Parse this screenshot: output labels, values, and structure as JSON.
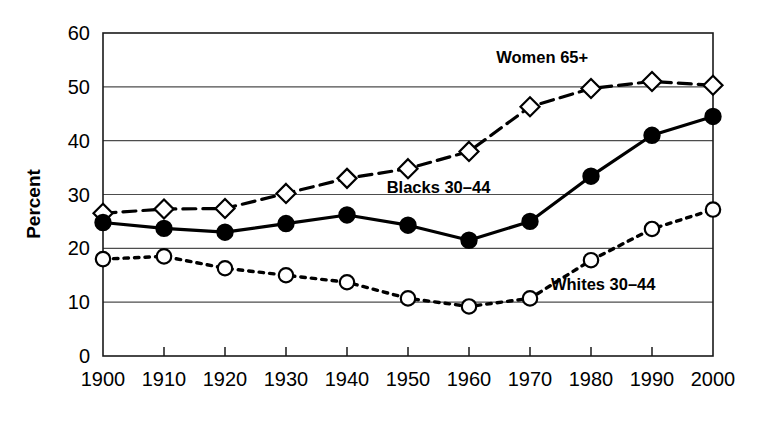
{
  "chart_data": {
    "type": "line",
    "title": "",
    "xlabel": "",
    "ylabel": "Percent",
    "x": [
      1900,
      1910,
      1920,
      1930,
      1940,
      1950,
      1960,
      1970,
      1980,
      1990,
      2000
    ],
    "xtick_labels": [
      "1900",
      "1910",
      "1920",
      "1930",
      "1940",
      "1950",
      "1960",
      "1970",
      "1980",
      "1990",
      "2000"
    ],
    "ytick_labels": [
      "0",
      "10",
      "20",
      "30",
      "40",
      "50",
      "60"
    ],
    "yticks": [
      0,
      10,
      20,
      30,
      40,
      50,
      60
    ],
    "ylim": [
      0,
      60
    ],
    "xlim": [
      1900,
      2000
    ],
    "grid": "horizontal",
    "legend_position": "inline-annotations",
    "series": [
      {
        "name": "Women 65+",
        "label": "Women 65+",
        "marker": "diamond-open",
        "linestyle": "dashed",
        "color": "#000000",
        "label_x": 1972,
        "label_y": 54.5,
        "values": [
          26.5,
          27.3,
          27.4,
          30.2,
          33.0,
          34.8,
          38.0,
          46.3,
          49.7,
          51.0,
          50.3
        ]
      },
      {
        "name": "Blacks 30-44",
        "label": "Blacks 30–44",
        "marker": "circle-filled",
        "linestyle": "solid",
        "color": "#000000",
        "label_x": 1955,
        "label_y": 30.2,
        "values": [
          24.8,
          23.7,
          23.0,
          24.6,
          26.2,
          24.3,
          21.5,
          25.0,
          33.4,
          41.0,
          44.5
        ]
      },
      {
        "name": "Whites 30-44",
        "label": "Whites 30–44",
        "marker": "circle-open",
        "linestyle": "dotted",
        "color": "#000000",
        "label_x": 1982,
        "label_y": 12.3,
        "values": [
          18.0,
          18.5,
          16.3,
          15.0,
          13.7,
          10.7,
          9.2,
          10.7,
          17.8,
          23.6,
          27.2
        ]
      }
    ]
  }
}
